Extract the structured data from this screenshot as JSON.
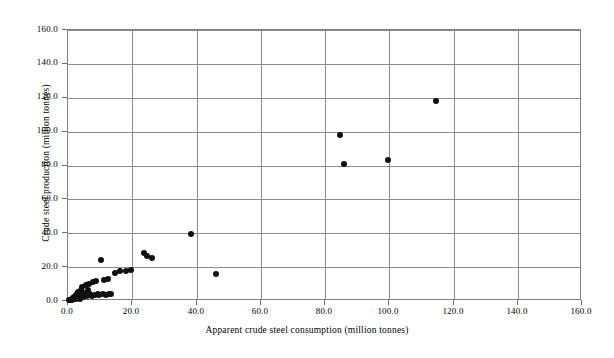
{
  "chart_data": {
    "type": "scatter",
    "title": "",
    "xlabel": "Apparent crude steel consumption (million tonnes)",
    "ylabel": "Crude steel production (million tonnes)",
    "xlim": [
      0.0,
      160.0
    ],
    "ylim": [
      0.0,
      160.0
    ],
    "xticks": [
      "0.0",
      "20.0",
      "40.0",
      "60.0",
      "80.0",
      "100.0",
      "120.0",
      "140.0",
      "160.0"
    ],
    "yticks": [
      "0.0",
      "20.0",
      "40.0",
      "60.0",
      "80.0",
      "100.0",
      "120.0",
      "140.0",
      "160.0"
    ],
    "xtick_values": [
      0,
      20,
      40,
      60,
      80,
      100,
      120,
      140,
      160
    ],
    "ytick_values": [
      0,
      20,
      40,
      60,
      80,
      100,
      120,
      140,
      160
    ],
    "grid": true,
    "legend": false,
    "marker": "filled-circle",
    "marker_color": "#101010",
    "marker_size": 6,
    "grid_color": "#8c8c8c",
    "plot_border_color": "#7f7f7f",
    "background_color": "#ffffff",
    "points": [
      [
        0.4,
        0.3
      ],
      [
        0.7,
        0.5
      ],
      [
        1.0,
        0.8
      ],
      [
        1.2,
        1.2
      ],
      [
        1.4,
        0.6
      ],
      [
        1.6,
        2.0
      ],
      [
        1.8,
        1.0
      ],
      [
        2.0,
        2.6
      ],
      [
        2.2,
        1.6
      ],
      [
        2.4,
        3.4
      ],
      [
        2.6,
        0.9
      ],
      [
        2.8,
        4.4
      ],
      [
        3.0,
        2.2
      ],
      [
        3.2,
        5.6
      ],
      [
        3.4,
        3.0
      ],
      [
        3.6,
        1.4
      ],
      [
        3.9,
        6.6
      ],
      [
        4.2,
        4.0
      ],
      [
        4.5,
        8.0
      ],
      [
        4.8,
        2.4
      ],
      [
        5.1,
        5.0
      ],
      [
        5.5,
        9.2
      ],
      [
        5.9,
        3.2
      ],
      [
        6.2,
        6.2
      ],
      [
        6.6,
        10.0
      ],
      [
        7.0,
        4.2
      ],
      [
        7.4,
        2.8
      ],
      [
        7.9,
        11.0
      ],
      [
        8.3,
        3.6
      ],
      [
        8.8,
        12.0
      ],
      [
        9.2,
        4.0
      ],
      [
        9.8,
        3.4
      ],
      [
        10.4,
        24.0
      ],
      [
        10.8,
        4.2
      ],
      [
        11.3,
        12.6
      ],
      [
        11.8,
        3.8
      ],
      [
        12.4,
        13.2
      ],
      [
        12.9,
        4.4
      ],
      [
        13.4,
        4.0
      ],
      [
        14.6,
        16.6
      ],
      [
        16.2,
        17.8
      ],
      [
        18.0,
        18.0
      ],
      [
        19.6,
        18.2
      ],
      [
        23.6,
        28.6
      ],
      [
        24.6,
        26.4
      ],
      [
        26.0,
        25.4
      ],
      [
        38.2,
        39.6
      ],
      [
        46.0,
        15.8
      ],
      [
        84.6,
        98.0
      ],
      [
        86.0,
        81.0
      ],
      [
        99.6,
        83.4
      ],
      [
        114.6,
        117.8
      ]
    ]
  }
}
